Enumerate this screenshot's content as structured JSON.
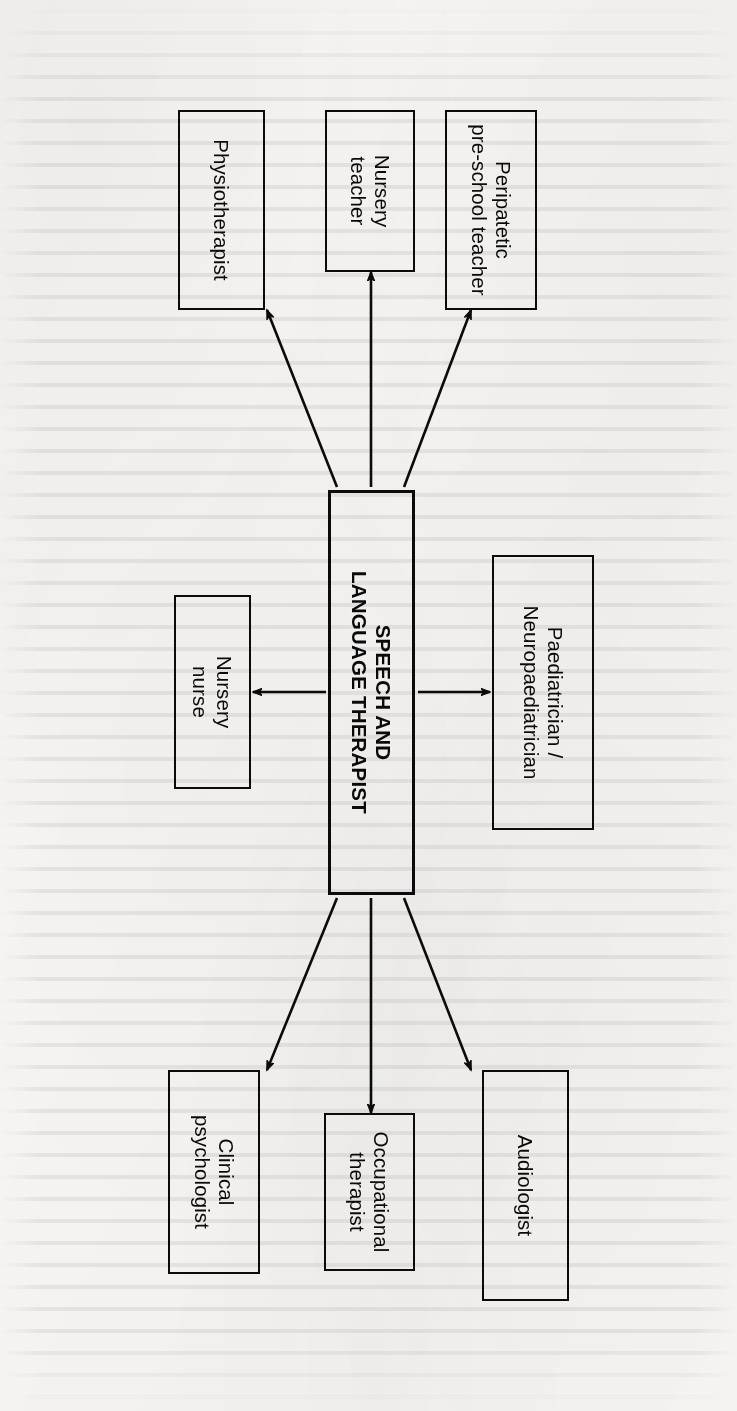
{
  "document": {
    "kind": "scanned-book-figure",
    "orientation": "rotated-90-clockwise",
    "page_background": "#f6f5f3",
    "ink_color": "#0b0b0b"
  },
  "diagram": {
    "type": "hub-and-spoke",
    "center": {
      "id": "speech-and-language-therapist",
      "label": "SPEECH AND\nLANGUAGE THERAPIST",
      "bold": true
    },
    "nodes": [
      {
        "id": "paediatrician-neuropaediatrician",
        "label": "Paediatrician /\nNeuropaediatrician"
      },
      {
        "id": "audiologist",
        "label": "Audiologist"
      },
      {
        "id": "clinical-psychologist",
        "label": "Clinical\npsychologist"
      },
      {
        "id": "peripatetic-pre-school-teacher",
        "label": "Peripatetic\npre-school teacher"
      },
      {
        "id": "physiotherapist",
        "label": "Physiotherapist"
      },
      {
        "id": "nursery-teacher",
        "label": "Nursery\nteacher"
      },
      {
        "id": "nursery-nurse",
        "label": "Nursery\nnurse"
      },
      {
        "id": "occupational-therapist",
        "label": "Occupational\ntherapist"
      }
    ],
    "edges": [
      {
        "from": "speech-and-language-therapist",
        "to": "paediatrician-neuropaediatrician",
        "arrow": "single"
      },
      {
        "from": "speech-and-language-therapist",
        "to": "audiologist",
        "arrow": "single"
      },
      {
        "from": "speech-and-language-therapist",
        "to": "clinical-psychologist",
        "arrow": "single"
      },
      {
        "from": "speech-and-language-therapist",
        "to": "peripatetic-pre-school-teacher",
        "arrow": "single"
      },
      {
        "from": "speech-and-language-therapist",
        "to": "physiotherapist",
        "arrow": "single"
      },
      {
        "from": "speech-and-language-therapist",
        "to": "nursery-teacher",
        "arrow": "single"
      },
      {
        "from": "speech-and-language-therapist",
        "to": "nursery-nurse",
        "arrow": "single"
      },
      {
        "from": "speech-and-language-therapist",
        "to": "occupational-therapist",
        "arrow": "single"
      }
    ]
  }
}
